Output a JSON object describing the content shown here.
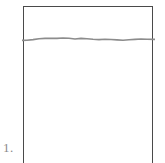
{
  "figure": {
    "label": "1.",
    "label_color": "#8a8a8a",
    "background_color": "#ffffff",
    "panel": {
      "name": "rectangular-panel",
      "border_color": "#4a4a4a",
      "fill_color": "#ffffff",
      "open_bottom": true
    },
    "annotations": {
      "wavy_line": {
        "name": "wavy-horizontal-line",
        "color": "#8c8c8c",
        "stroke_width": 1.6,
        "description": "irregular near-horizontal line spanning the full width of the panel near its top"
      }
    }
  },
  "chart_data": {
    "type": "line",
    "title": "",
    "xlabel": "",
    "ylabel": "",
    "xlim": [
      0,
      133
    ],
    "ylim": [
      0,
      18
    ],
    "grid": false,
    "legend": null,
    "series": [
      {
        "name": "wavy-line",
        "color": "#8c8c8c",
        "x": [
          0,
          5,
          11,
          17,
          23,
          29,
          35,
          41,
          47,
          53,
          59,
          65,
          71,
          77,
          83,
          89,
          95,
          101,
          107,
          113,
          119,
          125,
          133
        ],
        "y": [
          10.4,
          10.2,
          9.6,
          8.8,
          8.4,
          8.2,
          8.4,
          8.0,
          8.3,
          9.0,
          8.4,
          8.7,
          9.3,
          9.6,
          9.2,
          9.5,
          9.9,
          10.2,
          9.8,
          9.4,
          9.0,
          9.2,
          9.4
        ]
      }
    ]
  }
}
